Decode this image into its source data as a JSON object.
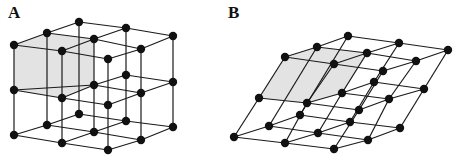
{
  "panels": [
    {
      "label": "A",
      "description": "cubic lattice",
      "label_pos": [
        13,
        19
      ],
      "shaded_face": [
        [
          14,
          45
        ],
        [
          62,
          51
        ],
        [
          62,
          98
        ],
        [
          14,
          90
        ]
      ],
      "shaded_top": [
        [
          14,
          45
        ],
        [
          47,
          33
        ],
        [
          94,
          39
        ],
        [
          62,
          51
        ]
      ],
      "shaded_side": [
        [
          62,
          51
        ],
        [
          94,
          39
        ],
        [
          94,
          85
        ],
        [
          62,
          98
        ]
      ],
      "nodes": [
        [
          14,
          45
        ],
        [
          62,
          51
        ],
        [
          108,
          59
        ],
        [
          47,
          33
        ],
        [
          94,
          39
        ],
        [
          141,
          49
        ],
        [
          79,
          22
        ],
        [
          126,
          28
        ],
        [
          173,
          36
        ],
        [
          14,
          90
        ],
        [
          62,
          98
        ],
        [
          108,
          105
        ],
        [
          94,
          85
        ],
        [
          141,
          93
        ],
        [
          126,
          75
        ],
        [
          173,
          82
        ],
        [
          14,
          135
        ],
        [
          62,
          143
        ],
        [
          108,
          150
        ],
        [
          47,
          125
        ],
        [
          94,
          132
        ],
        [
          141,
          140
        ],
        [
          79,
          114
        ],
        [
          126,
          121
        ],
        [
          173,
          127
        ]
      ],
      "edges": [
        [
          0,
          1
        ],
        [
          1,
          2
        ],
        [
          3,
          4
        ],
        [
          4,
          5
        ],
        [
          6,
          7
        ],
        [
          7,
          8
        ],
        [
          0,
          3
        ],
        [
          3,
          6
        ],
        [
          1,
          4
        ],
        [
          4,
          7
        ],
        [
          2,
          5
        ],
        [
          5,
          8
        ],
        [
          9,
          10
        ],
        [
          10,
          11
        ],
        [
          12,
          13
        ],
        [
          14,
          15
        ],
        [
          9,
          12
        ],
        [
          12,
          14
        ],
        [
          10,
          12
        ],
        [
          11,
          13
        ],
        [
          13,
          15
        ],
        [
          16,
          17
        ],
        [
          17,
          18
        ],
        [
          19,
          20
        ],
        [
          20,
          21
        ],
        [
          22,
          23
        ],
        [
          23,
          24
        ],
        [
          16,
          19
        ],
        [
          19,
          22
        ],
        [
          17,
          20
        ],
        [
          20,
          23
        ],
        [
          18,
          21
        ],
        [
          21,
          24
        ],
        [
          0,
          9
        ],
        [
          9,
          16
        ],
        [
          1,
          10
        ],
        [
          10,
          17
        ],
        [
          2,
          11
        ],
        [
          11,
          18
        ],
        [
          6,
          22
        ],
        [
          7,
          14
        ],
        [
          14,
          23
        ],
        [
          8,
          15
        ],
        [
          15,
          24
        ],
        [
          4,
          12
        ],
        [
          12,
          20
        ],
        [
          5,
          13
        ],
        [
          13,
          21
        ],
        [
          3,
          19
        ]
      ]
    },
    {
      "label": "B",
      "description": "sheared lattice",
      "label_pos": [
        232,
        19
      ],
      "shaded_face": [
        [
          285,
          57
        ],
        [
          334,
          64
        ],
        [
          307,
          103
        ],
        [
          259,
          98
        ]
      ],
      "shaded_top": [
        [
          285,
          57
        ],
        [
          317,
          47
        ],
        [
          367,
          53
        ],
        [
          334,
          64
        ]
      ],
      "shaded_side": [
        [
          334,
          64
        ],
        [
          367,
          53
        ],
        [
          342,
          93
        ],
        [
          307,
          103
        ]
      ],
      "nodes": [
        [
          285,
          57
        ],
        [
          334,
          64
        ],
        [
          383,
          71
        ],
        [
          317,
          47
        ],
        [
          367,
          53
        ],
        [
          416,
          61
        ],
        [
          348,
          36
        ],
        [
          399,
          43
        ],
        [
          448,
          50
        ],
        [
          259,
          98
        ],
        [
          307,
          103
        ],
        [
          359,
          110
        ],
        [
          342,
          93
        ],
        [
          389,
          99
        ],
        [
          374,
          82
        ],
        [
          424,
          89
        ],
        [
          234,
          137
        ],
        [
          285,
          143
        ],
        [
          334,
          149
        ],
        [
          269,
          126
        ],
        [
          318,
          133
        ],
        [
          368,
          140
        ],
        [
          300,
          115
        ],
        [
          350,
          122
        ],
        [
          400,
          128
        ]
      ],
      "edges": [
        [
          0,
          1
        ],
        [
          1,
          2
        ],
        [
          3,
          4
        ],
        [
          4,
          5
        ],
        [
          6,
          7
        ],
        [
          7,
          8
        ],
        [
          0,
          3
        ],
        [
          3,
          6
        ],
        [
          1,
          4
        ],
        [
          4,
          7
        ],
        [
          2,
          5
        ],
        [
          5,
          8
        ],
        [
          9,
          10
        ],
        [
          10,
          11
        ],
        [
          12,
          13
        ],
        [
          14,
          15
        ],
        [
          10,
          12
        ],
        [
          12,
          14
        ],
        [
          11,
          13
        ],
        [
          13,
          15
        ],
        [
          16,
          17
        ],
        [
          17,
          18
        ],
        [
          19,
          20
        ],
        [
          20,
          21
        ],
        [
          22,
          23
        ],
        [
          23,
          24
        ],
        [
          16,
          19
        ],
        [
          19,
          22
        ],
        [
          17,
          20
        ],
        [
          20,
          23
        ],
        [
          18,
          21
        ],
        [
          21,
          24
        ],
        [
          0,
          9
        ],
        [
          9,
          16
        ],
        [
          1,
          10
        ],
        [
          10,
          17
        ],
        [
          2,
          11
        ],
        [
          11,
          18
        ],
        [
          6,
          22
        ],
        [
          7,
          14
        ],
        [
          14,
          23
        ],
        [
          8,
          15
        ],
        [
          15,
          24
        ],
        [
          4,
          12
        ],
        [
          12,
          20
        ],
        [
          5,
          13
        ],
        [
          13,
          21
        ],
        [
          3,
          19
        ]
      ]
    }
  ],
  "colors": {
    "edge": "#1a1a1a",
    "node": "#111111",
    "face": "#e3e3e3"
  }
}
